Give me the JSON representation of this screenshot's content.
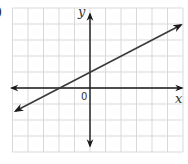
{
  "problem_label": ")",
  "chart_data": {
    "type": "line",
    "title": "",
    "xlabel": "x",
    "ylabel": "y",
    "origin_label": "0",
    "xlim": [
      -5,
      6
    ],
    "ylim": [
      -4,
      5
    ],
    "grid": true,
    "series": [
      {
        "name": "line",
        "equation": "y = 0.5x + 1",
        "x": [
          -5,
          -2,
          0,
          6
        ],
        "y": [
          -1.5,
          0,
          1,
          4
        ],
        "arrows_both_ends": true
      }
    ]
  },
  "colors": {
    "grid": "#d9d9d9",
    "axis": "#1a1a1a",
    "line": "#3a3a3a"
  }
}
